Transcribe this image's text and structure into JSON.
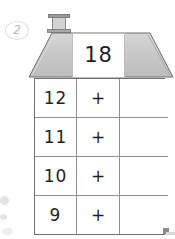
{
  "worksheet": {
    "question_number": "2",
    "title_value": "18",
    "operator": "+",
    "columns": [
      "addend",
      "operator",
      "sum"
    ],
    "rows": [
      {
        "addend": "12",
        "operator": "+",
        "sum": ""
      },
      {
        "addend": "11",
        "operator": "+",
        "sum": ""
      },
      {
        "addend": "10",
        "operator": "+",
        "sum": ""
      },
      {
        "addend": "9",
        "operator": "+",
        "sum": ""
      }
    ],
    "icons": {
      "chimney": "chimney-icon",
      "roof": "roof-icon"
    },
    "colors": {
      "roof_fill": "#c9c9c9",
      "roof_stroke": "#6e6e6e",
      "grid_stroke": "#8f8f8f",
      "text": "#1f1f1f",
      "question_number": "#b9b9b9"
    }
  }
}
